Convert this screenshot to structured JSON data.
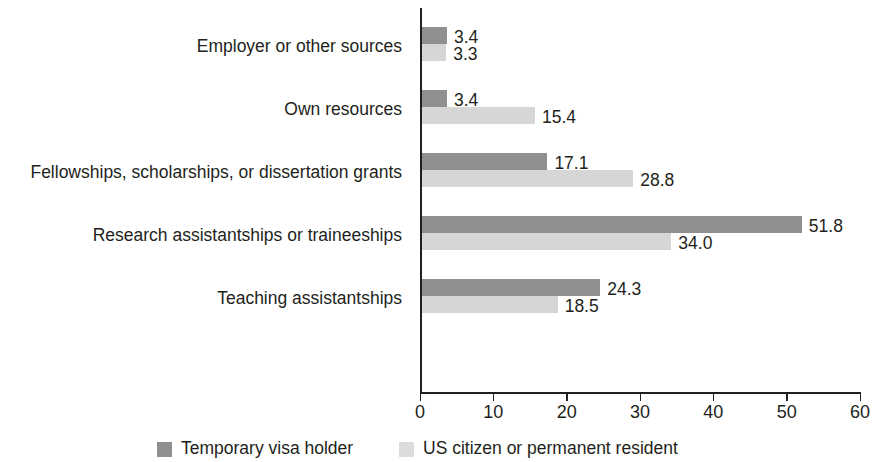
{
  "chart_data": {
    "type": "bar",
    "orientation": "horizontal",
    "title": "",
    "subtitle": "",
    "xlabel": "",
    "ylabel": "",
    "xlim": [
      0,
      60
    ],
    "xticks": [
      0,
      10,
      20,
      30,
      40,
      50,
      60
    ],
    "xtick_labels": [
      "0",
      "10",
      "20",
      "30",
      "40",
      "50",
      "60"
    ],
    "grid": false,
    "legend_position": "bottom",
    "categories": [
      "Employer or other sources",
      "Own resources",
      "Fellowships, scholarships, or dissertation grants",
      "Research assistantships or traineeships",
      "Teaching assistantships"
    ],
    "series": [
      {
        "name": "Temporary visa holder",
        "color": "#8f8f8f",
        "values": [
          3.4,
          3.4,
          17.1,
          51.8,
          24.3
        ],
        "value_labels": [
          "3.4",
          "3.4",
          "17.1",
          "51.8",
          "24.3"
        ]
      },
      {
        "name": "US citizen or permanent resident",
        "color": "#d6d6d6",
        "values": [
          3.3,
          15.4,
          28.8,
          34.0,
          18.5
        ],
        "value_labels": [
          "3.3",
          "15.4",
          "28.8",
          "34.0",
          "18.5"
        ]
      }
    ]
  },
  "legend": {
    "items": [
      {
        "label": "Temporary visa holder",
        "swatch": "series-0"
      },
      {
        "label": "US citizen or permanent resident",
        "swatch": "series-1"
      }
    ]
  }
}
